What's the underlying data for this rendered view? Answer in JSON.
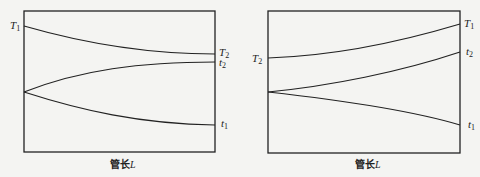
{
  "diagrams": [
    {
      "id": "left",
      "xlabel": "管长",
      "xlabel_var": "L",
      "curves": [
        {
          "name": "T",
          "sub": "1",
          "label_side": "left"
        },
        {
          "name": "T",
          "sub": "2",
          "label_side": "right"
        },
        {
          "name": "t",
          "sub": "2",
          "label_side": "right"
        },
        {
          "name": "t",
          "sub": "1",
          "label_side": "right"
        }
      ]
    },
    {
      "id": "right",
      "xlabel": "管长",
      "xlabel_var": "L",
      "curves": [
        {
          "name": "T",
          "sub": "2",
          "label_side": "left"
        },
        {
          "name": "T",
          "sub": "1",
          "label_side": "right"
        },
        {
          "name": "t",
          "sub": "2",
          "label_side": "right"
        },
        {
          "name": "t",
          "sub": "1",
          "label_side": "right"
        }
      ]
    }
  ]
}
